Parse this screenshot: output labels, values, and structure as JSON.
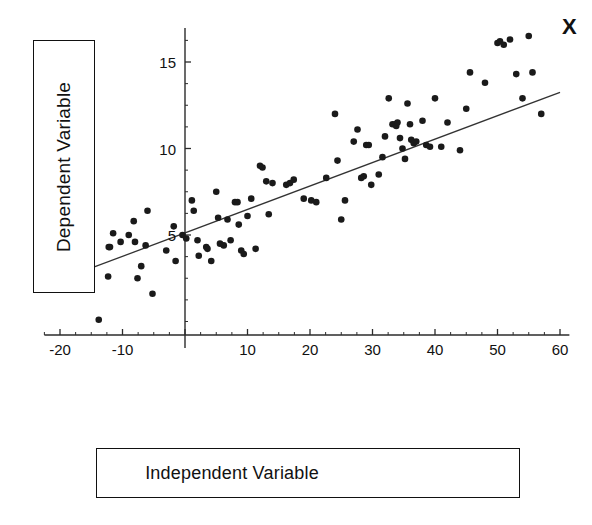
{
  "figure": {
    "y_axis_label": "Dependent Variable",
    "x_axis_label": "Independent Variable",
    "corner_marker": "X"
  },
  "chart_data": {
    "type": "scatter",
    "title": "",
    "xlabel": "Independent Variable",
    "ylabel": "Dependent Variable",
    "xlim": [
      -22,
      62
    ],
    "ylim": [
      0,
      17.5
    ],
    "xticks": [
      -20,
      -10,
      0,
      10,
      20,
      30,
      40,
      50,
      60
    ],
    "xtick_labels": [
      "-20",
      "-10",
      "",
      "10",
      "20",
      "30",
      "40",
      "50",
      "60"
    ],
    "yticks": [
      5,
      10,
      15
    ],
    "ytick_labels": [
      "5",
      "10",
      "15"
    ],
    "minor_tick_step": 2.5,
    "grid": false,
    "legend": null,
    "marker": {
      "shape": "circle",
      "size": 4,
      "color": "#1a1a1a"
    },
    "trendline": {
      "type": "linear",
      "color": "#333333",
      "slope": 0.1355,
      "intercept": 5.12,
      "x_start": -22.0,
      "x_end": 60.0,
      "y_start": 2.14,
      "y_end": 13.25
    },
    "annotations": [
      {
        "text": "X",
        "x": 60.5,
        "y": 17.2,
        "style": "bold"
      }
    ],
    "points": [
      [
        -15.0,
        2.9
      ],
      [
        -13.8,
        0.1
      ],
      [
        -12.2,
        4.3
      ],
      [
        -12.0,
        4.3
      ],
      [
        -11.5,
        5.1
      ],
      [
        -12.3,
        2.6
      ],
      [
        -10.3,
        4.6
      ],
      [
        -9.0,
        5.0
      ],
      [
        -8.2,
        5.8
      ],
      [
        -8.0,
        4.6
      ],
      [
        -7.6,
        2.5
      ],
      [
        -7.0,
        3.2
      ],
      [
        -6.3,
        4.4
      ],
      [
        -6.0,
        6.4
      ],
      [
        -5.2,
        1.6
      ],
      [
        -3.0,
        4.1
      ],
      [
        -1.8,
        5.5
      ],
      [
        -1.5,
        3.5
      ],
      [
        -0.4,
        5.0
      ],
      [
        0.2,
        4.8
      ],
      [
        1.1,
        7.0
      ],
      [
        1.4,
        6.4
      ],
      [
        2.0,
        4.7
      ],
      [
        2.2,
        3.8
      ],
      [
        3.4,
        4.3
      ],
      [
        3.6,
        4.2
      ],
      [
        4.2,
        3.5
      ],
      [
        5.0,
        7.5
      ],
      [
        5.3,
        6.0
      ],
      [
        5.6,
        4.5
      ],
      [
        6.2,
        4.4
      ],
      [
        6.8,
        5.9
      ],
      [
        7.3,
        4.7
      ],
      [
        8.0,
        6.9
      ],
      [
        8.4,
        6.9
      ],
      [
        8.6,
        5.6
      ],
      [
        9.0,
        4.1
      ],
      [
        9.4,
        3.9
      ],
      [
        10.0,
        6.1
      ],
      [
        10.6,
        7.1
      ],
      [
        11.3,
        4.2
      ],
      [
        12.0,
        9.0
      ],
      [
        12.4,
        8.9
      ],
      [
        13.0,
        8.1
      ],
      [
        13.4,
        6.2
      ],
      [
        14.0,
        8.0
      ],
      [
        16.2,
        7.9
      ],
      [
        16.8,
        8.0
      ],
      [
        17.4,
        8.2
      ],
      [
        19.0,
        7.1
      ],
      [
        20.2,
        7.0
      ],
      [
        21.0,
        6.9
      ],
      [
        22.6,
        8.3
      ],
      [
        24.0,
        12.0
      ],
      [
        24.4,
        9.3
      ],
      [
        25.0,
        5.9
      ],
      [
        25.6,
        7.0
      ],
      [
        27.0,
        10.4
      ],
      [
        27.6,
        11.1
      ],
      [
        28.2,
        8.3
      ],
      [
        28.6,
        8.4
      ],
      [
        29.0,
        10.2
      ],
      [
        29.4,
        10.2
      ],
      [
        29.8,
        7.9
      ],
      [
        31.0,
        8.5
      ],
      [
        31.6,
        9.5
      ],
      [
        32.0,
        10.7
      ],
      [
        32.6,
        12.9
      ],
      [
        33.2,
        11.4
      ],
      [
        33.6,
        11.4
      ],
      [
        33.8,
        11.3
      ],
      [
        34.0,
        11.5
      ],
      [
        34.4,
        10.6
      ],
      [
        34.8,
        10.0
      ],
      [
        35.2,
        9.4
      ],
      [
        35.6,
        12.6
      ],
      [
        36.0,
        11.4
      ],
      [
        36.2,
        10.5
      ],
      [
        36.6,
        10.3
      ],
      [
        37.0,
        10.4
      ],
      [
        38.0,
        11.6
      ],
      [
        38.6,
        10.2
      ],
      [
        39.2,
        10.1
      ],
      [
        40.0,
        12.9
      ],
      [
        41.0,
        10.1
      ],
      [
        42.0,
        11.5
      ],
      [
        44.0,
        9.9
      ],
      [
        45.0,
        12.3
      ],
      [
        45.6,
        14.4
      ],
      [
        48.0,
        13.8
      ],
      [
        50.0,
        16.1
      ],
      [
        50.4,
        16.2
      ],
      [
        51.0,
        16.0
      ],
      [
        52.0,
        16.3
      ],
      [
        53.0,
        14.3
      ],
      [
        54.0,
        12.9
      ],
      [
        55.0,
        16.5
      ],
      [
        55.6,
        14.4
      ],
      [
        57.0,
        12.0
      ]
    ]
  }
}
